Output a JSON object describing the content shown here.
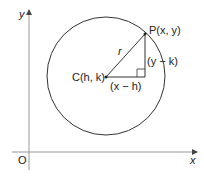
{
  "diagram": {
    "type": "geometry",
    "axes": {
      "x_label": "x",
      "y_label": "y",
      "origin_label": "O"
    },
    "labels": {
      "point_p": "P(x, y)",
      "point_c": "C(h, k)",
      "radius": "r",
      "horizontal_leg": "(x − h)",
      "vertical_leg": "(y − k)"
    },
    "colors": {
      "line": "#333333",
      "axis": "#888888"
    }
  }
}
